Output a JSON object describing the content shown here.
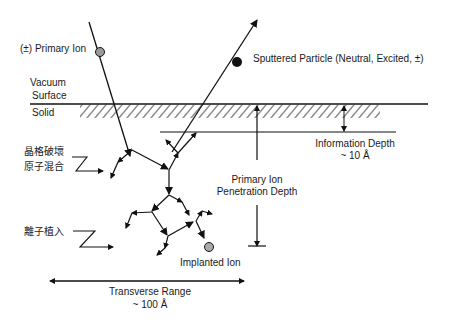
{
  "diagram": {
    "type": "ion-solid-interaction-schematic",
    "labels": {
      "primary_ion": "(±) Primary Ion",
      "sputtered_particle": "Sputtered Particle (Neutral, Excited, ±)",
      "vacuum": "Vacuum",
      "surface": "Surface",
      "solid": "Solid",
      "information_depth_line1": "Information Depth",
      "information_depth_line2": "~ 10 Å",
      "penetration_line1": "Primary Ion",
      "penetration_line2": "Penetration Depth",
      "lattice_damage_line1": "晶格破壞",
      "lattice_damage_line2": "原子混合",
      "ion_implantation": "離子植入",
      "implanted_ion": "Implanted Ion",
      "transverse_line1": "Transverse Range",
      "transverse_line2": "~ 100 Å"
    },
    "colors": {
      "line": "#111111",
      "primary_ion_fill": "#9a9a9a",
      "sputtered_fill": "#111111",
      "implanted_fill": "#aaaaaa",
      "background": "#ffffff"
    }
  }
}
